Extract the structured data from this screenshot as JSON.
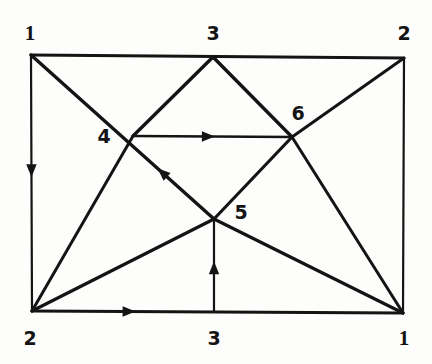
{
  "figure": {
    "kind": "directed-graph-diagram",
    "background_color": "#fdfdfc",
    "ink_color": "#141414",
    "width": 432,
    "height": 364
  },
  "graph": {
    "vertices": [
      {
        "id": "v1-top-left",
        "label": "1",
        "x": 31,
        "y": 55,
        "label_x": 30,
        "label_y": 33,
        "style": "thin-one"
      },
      {
        "id": "v3-top",
        "label": "3",
        "x": 213,
        "y": 57,
        "label_x": 213,
        "label_y": 33,
        "style": "normal"
      },
      {
        "id": "v2-top-right",
        "label": "2",
        "x": 404,
        "y": 58,
        "label_x": 404,
        "label_y": 33,
        "style": "normal"
      },
      {
        "id": "v4-middle-left",
        "label": "4",
        "x": 133,
        "y": 136,
        "label_x": 104,
        "label_y": 136,
        "style": "normal"
      },
      {
        "id": "v6-middle-right",
        "label": "6",
        "x": 292,
        "y": 137,
        "label_x": 298,
        "label_y": 113,
        "style": "normal"
      },
      {
        "id": "v5-center",
        "label": "5",
        "x": 214,
        "y": 219,
        "label_x": 241,
        "label_y": 212,
        "style": "normal"
      },
      {
        "id": "v2-bottom-left",
        "label": "2",
        "x": 32,
        "y": 311,
        "label_x": 30,
        "label_y": 338,
        "style": "normal"
      },
      {
        "id": "v3-bottom",
        "label": "3",
        "x": 214,
        "y": 312,
        "label_x": 214,
        "label_y": 338,
        "style": "normal"
      },
      {
        "id": "v1-bottom-right",
        "label": "1",
        "x": 403,
        "y": 313,
        "label_x": 404,
        "label_y": 338,
        "style": "thin-one"
      }
    ],
    "edges": [
      {
        "id": "edge-top",
        "from": "v1-top-left",
        "to": "v2-top-right",
        "x1": 31,
        "y1": 55,
        "x2": 404,
        "y2": 58,
        "arrow": "none",
        "width": 3.0
      },
      {
        "id": "edge-left",
        "from": "v1-top-left",
        "to": "v2-bottom-left",
        "x1": 31,
        "y1": 55,
        "x2": 32,
        "y2": 311,
        "arrow": "middle",
        "arrow_t": 0.45,
        "width": 2.2
      },
      {
        "id": "edge-bottom",
        "from": "v2-bottom-left",
        "to": "v1-bottom-right",
        "x1": 32,
        "y1": 311,
        "x2": 403,
        "y2": 313,
        "arrow": "middle",
        "arrow_t": 0.26,
        "width": 3.0
      },
      {
        "id": "edge-right",
        "from": "v2-top-right",
        "to": "v1-bottom-right",
        "x1": 404,
        "y1": 58,
        "x2": 403,
        "y2": 313,
        "arrow": "none",
        "width": 2.2
      },
      {
        "id": "edge-1-to-5",
        "from": "v1-top-left",
        "to": "v5-center",
        "x1": 31,
        "y1": 55,
        "x2": 214,
        "y2": 219,
        "arrow": "middle",
        "arrow_t": 0.72,
        "arrow_reverse": true,
        "width": 3.4
      },
      {
        "id": "edge-3top-to-4",
        "from": "v3-top",
        "to": "v4-middle-left",
        "x1": 213,
        "y1": 57,
        "x2": 133,
        "y2": 136,
        "arrow": "none",
        "width": 3.4
      },
      {
        "id": "edge-4-to-2bottom",
        "from": "v4-middle-left",
        "to": "v2-bottom-left",
        "x1": 133,
        "y1": 136,
        "x2": 32,
        "y2": 311,
        "arrow": "none",
        "width": 3.0
      },
      {
        "id": "edge-4-to-6",
        "from": "v4-middle-left",
        "to": "v6-middle-right",
        "x1": 133,
        "y1": 136,
        "x2": 292,
        "y2": 137,
        "arrow": "middle",
        "arrow_t": 0.47,
        "width": 2.6
      },
      {
        "id": "edge-3top-to-6",
        "from": "v3-top",
        "to": "v6-middle-right",
        "x1": 213,
        "y1": 57,
        "x2": 292,
        "y2": 137,
        "arrow": "none",
        "width": 3.4
      },
      {
        "id": "edge-6-to-2top",
        "from": "v6-middle-right",
        "to": "v2-top-right",
        "x1": 292,
        "y1": 137,
        "x2": 404,
        "y2": 58,
        "arrow": "none",
        "width": 3.0
      },
      {
        "id": "edge-6-to-5",
        "from": "v6-middle-right",
        "to": "v5-center",
        "x1": 292,
        "y1": 137,
        "x2": 214,
        "y2": 219,
        "arrow": "none",
        "width": 3.2
      },
      {
        "id": "edge-6-to-1bottom",
        "from": "v6-middle-right",
        "to": "v1-bottom-right",
        "x1": 292,
        "y1": 137,
        "x2": 403,
        "y2": 313,
        "arrow": "none",
        "width": 3.0
      },
      {
        "id": "edge-2bottom-to-5",
        "from": "v2-bottom-left",
        "to": "v5-center",
        "x1": 32,
        "y1": 311,
        "x2": 214,
        "y2": 219,
        "arrow": "none",
        "width": 3.2
      },
      {
        "id": "edge-5-to-1bottom",
        "from": "v5-center",
        "to": "v1-bottom-right",
        "x1": 214,
        "y1": 219,
        "x2": 403,
        "y2": 313,
        "arrow": "none",
        "width": 3.2
      },
      {
        "id": "edge-3bottom-to-5",
        "from": "v3-bottom",
        "to": "v5-center",
        "x1": 214,
        "y1": 312,
        "x2": 214,
        "y2": 219,
        "arrow": "middle",
        "arrow_t": 0.47,
        "width": 2.2
      }
    ]
  }
}
